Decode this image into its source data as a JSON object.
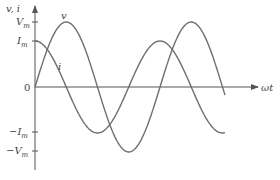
{
  "diagram": {
    "title": "",
    "y_axis_label": "v, i",
    "x_axis_label": "ωt",
    "origin_label": "0",
    "ticks": {
      "Vm": {
        "label": "V",
        "sub": "m"
      },
      "Im": {
        "label": "I",
        "sub": "m"
      },
      "neg_Im": {
        "label": "−I",
        "sub": "m"
      },
      "neg_Vm": {
        "label": "−V",
        "sub": "m"
      }
    },
    "curves": [
      {
        "name": "v",
        "label": "v",
        "shape": "sine",
        "amplitude": "V_m",
        "phase_deg": 0
      },
      {
        "name": "i",
        "label": "i",
        "shape": "cosine",
        "amplitude": "I_m",
        "phase_deg": 90,
        "note": "i leads v by 90°"
      }
    ],
    "colors": {
      "curve": "#6e6e6e",
      "axis": "#555555",
      "text": "#444444"
    }
  }
}
